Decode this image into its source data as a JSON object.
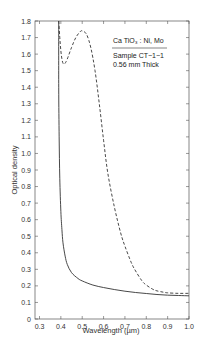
{
  "chart_data": {
    "type": "line",
    "title": "",
    "xlabel": "Wavelength (µm)",
    "ylabel": "Optical density",
    "xlim": [
      0.3,
      1.0
    ],
    "ylim": [
      0,
      1.8
    ],
    "x_ticks": [
      0.3,
      0.4,
      0.5,
      0.6,
      0.7,
      0.8,
      0.9,
      1.0
    ],
    "x_tick_labels": [
      "0.3",
      "0.4",
      "0.5",
      "0.6",
      "0.7",
      "0.8",
      "0.9",
      "1.0"
    ],
    "y_ticks": [
      0,
      0.1,
      0.2,
      0.3,
      0.4,
      0.5,
      0.6,
      0.7,
      0.8,
      0.9,
      1.0,
      1.1,
      1.2,
      1.3,
      1.4,
      1.5,
      1.6,
      1.7,
      1.8
    ],
    "y_tick_labels": [
      "0",
      "0.1",
      "0.2",
      "0.3",
      "0.4",
      "0.5",
      "0.6",
      "0.7",
      "0.8",
      "0.9",
      "1.0",
      "1.1",
      "1.2",
      "1.3",
      "1.4",
      "1.5",
      "1.6",
      "1.7",
      "1.8"
    ],
    "grid": false,
    "annotation": {
      "compound": "Ca TiO₃ : Ni, Mo",
      "sample": "Sample CT−1−1",
      "thickness": "0.56 mm Thick",
      "placement": "top-right"
    },
    "series": [
      {
        "name": "solid",
        "style": "solid",
        "x": [
          0.39,
          0.39,
          0.392,
          0.395,
          0.4,
          0.405,
          0.41,
          0.42,
          0.43,
          0.45,
          0.48,
          0.5,
          0.55,
          0.6,
          0.65,
          0.7,
          0.75,
          0.8,
          0.85,
          0.9,
          0.95,
          1.0
        ],
        "y": [
          1.8,
          1.4,
          1.1,
          0.85,
          0.65,
          0.54,
          0.46,
          0.38,
          0.33,
          0.28,
          0.245,
          0.23,
          0.205,
          0.19,
          0.178,
          0.168,
          0.16,
          0.154,
          0.148,
          0.144,
          0.142,
          0.14
        ]
      },
      {
        "name": "dashed",
        "style": "dashed",
        "x": [
          0.39,
          0.395,
          0.4,
          0.405,
          0.41,
          0.415,
          0.42,
          0.43,
          0.45,
          0.47,
          0.49,
          0.5,
          0.52,
          0.54,
          0.56,
          0.58,
          0.6,
          0.62,
          0.65,
          0.68,
          0.7,
          0.73,
          0.75,
          0.78,
          0.8,
          0.83,
          0.85,
          0.88,
          0.9,
          0.95,
          1.0
        ],
        "y": [
          1.8,
          1.7,
          1.62,
          1.57,
          1.545,
          1.54,
          1.545,
          1.57,
          1.64,
          1.7,
          1.735,
          1.74,
          1.72,
          1.64,
          1.5,
          1.3,
          1.08,
          0.88,
          0.68,
          0.52,
          0.44,
          0.34,
          0.29,
          0.23,
          0.205,
          0.18,
          0.17,
          0.162,
          0.158,
          0.155,
          0.155
        ]
      }
    ]
  }
}
